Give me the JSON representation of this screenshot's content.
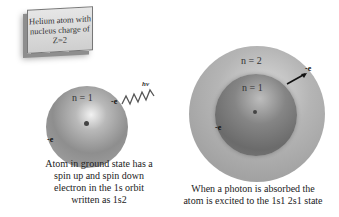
{
  "label_box": {
    "lines": [
      "Helium atom with",
      "nucleus charge of",
      "Z=2"
    ]
  },
  "ground_state_atom": {
    "shell_label": "n = 1",
    "electron_top_label": "-e",
    "electron_bottom_label": "-e",
    "photon_label": "hv",
    "caption_lines": [
      "Atom in ground state has a",
      "spin up and spin down",
      "electron in the 1s orbit",
      "written as 1s2"
    ]
  },
  "excited_atom": {
    "outer_shell_label": "n = 2",
    "inner_shell_label": "n = 1",
    "electron_outer_label": "-e",
    "electron_inner_label": "-e",
    "caption_lines": [
      "When a photon is absorbed the",
      "atom is excited to the 1s1 2s1 state"
    ]
  },
  "colors": {
    "background": "#ffffff",
    "sphere_gray": "#8e8e8e",
    "text": "#222222"
  }
}
